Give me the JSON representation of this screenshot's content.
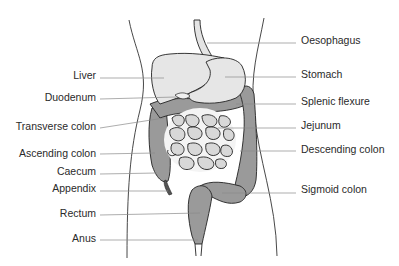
{
  "diagram": {
    "colors": {
      "background": "#ffffff",
      "outline": "#222222",
      "leader_line": "#8a8a8a",
      "light_organ": "#e2e2e2",
      "colon": "#9a9a9a",
      "small_intestine": "#d8d8d8",
      "label_text": "#2a2a2a"
    },
    "labels_left": [
      {
        "text": "Liver",
        "y": 75
      },
      {
        "text": "Duodenum",
        "y": 97
      },
      {
        "text": "Transverse colon",
        "y": 126
      },
      {
        "text": "Ascending colon",
        "y": 153
      },
      {
        "text": "Caecum",
        "y": 171
      },
      {
        "text": "Appendix",
        "y": 188
      },
      {
        "text": "Rectum",
        "y": 213
      },
      {
        "text": "Anus",
        "y": 238
      }
    ],
    "labels_right": [
      {
        "text": "Oesophagus",
        "y": 40
      },
      {
        "text": "Stomach",
        "y": 74
      },
      {
        "text": "Splenic flexure",
        "y": 101
      },
      {
        "text": "Jejunum",
        "y": 125
      },
      {
        "text": "Descending colon",
        "y": 149
      },
      {
        "text": "Sigmoid colon",
        "y": 189
      }
    ]
  }
}
